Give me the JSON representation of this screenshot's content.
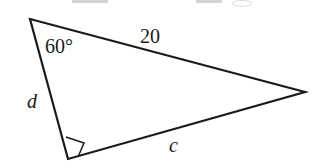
{
  "figure": {
    "kind": "geometry-diagram",
    "shape": "right-triangle",
    "background_color": "#ffffff",
    "stroke_color": "#1a1a1a",
    "stroke_width": 2.2,
    "canvas": {
      "width": 318,
      "height": 168
    },
    "vertices": {
      "apex": {
        "name": "top-left-vertex",
        "x": 30,
        "y": 19
      },
      "right": {
        "name": "right-vertex",
        "x": 305,
        "y": 92
      },
      "bottom": {
        "name": "bottom-vertex",
        "x": 68,
        "y": 159
      }
    },
    "right_angle_marker": {
      "at_vertex": "bottom",
      "size": 17,
      "visible": true
    },
    "labels": {
      "angle": {
        "text": "60°",
        "value": 60,
        "unit": "degrees",
        "at_vertex": "apex",
        "x": 45,
        "y": 36
      },
      "side_top": {
        "text": "20",
        "value": 20,
        "between": "apex-right",
        "x": 140,
        "y": 26
      },
      "side_left": {
        "text": "d",
        "value": null,
        "between": "apex-bottom",
        "x": 27,
        "y": 91
      },
      "side_bottom": {
        "text": "c",
        "value": null,
        "between": "bottom-right",
        "x": 169,
        "y": 135
      }
    },
    "crop_artifacts": [
      {
        "name": "crop-artifact-bar-left",
        "x": 72,
        "y": 0,
        "width": 36,
        "height": 3,
        "kind": "bar"
      },
      {
        "name": "crop-artifact-bar-right",
        "x": 196,
        "y": 0,
        "width": 26,
        "height": 3,
        "kind": "bar"
      },
      {
        "name": "crop-artifact-oval",
        "x": 232,
        "y": 0,
        "width": 18,
        "height": 5,
        "kind": "oval"
      }
    ]
  }
}
